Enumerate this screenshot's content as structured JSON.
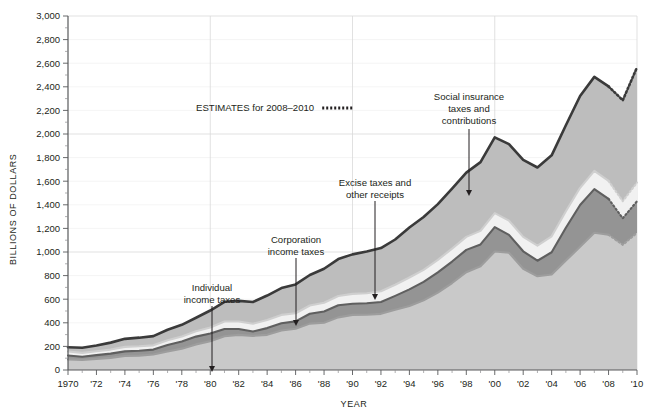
{
  "chart_data": {
    "type": "area",
    "title": "",
    "xlabel": "YEAR",
    "ylabel": "BILLIONS OF DOLLARS",
    "xlim": [
      1970,
      2010
    ],
    "ylim": [
      0,
      3000
    ],
    "ytick_step": 200,
    "grid": true,
    "stacked": true,
    "estimate_start_year": 2008,
    "x": [
      1970,
      1971,
      1972,
      1973,
      1974,
      1975,
      1976,
      1977,
      1978,
      1979,
      1980,
      1981,
      1982,
      1983,
      1984,
      1985,
      1986,
      1987,
      1988,
      1989,
      1990,
      1991,
      1992,
      1993,
      1994,
      1995,
      1996,
      1997,
      1998,
      1999,
      2000,
      2001,
      2002,
      2003,
      2004,
      2005,
      2006,
      2007,
      2008,
      2009,
      2010
    ],
    "xticklabels": [
      "1970",
      "'72",
      "'74",
      "'76",
      "'78",
      "'80",
      "'82",
      "'84",
      "'86",
      "'88",
      "'90",
      "'92",
      "'94",
      "'96",
      "'98",
      "'00",
      "'02",
      "'04",
      "'06",
      "'08",
      "'10"
    ],
    "yticklabels": [
      "0",
      "200",
      "400",
      "600",
      "800",
      "1,000",
      "1,200",
      "1,400",
      "1,600",
      "1,800",
      "2,000",
      "2,200",
      "2,400",
      "2,600",
      "2,800",
      "3,000"
    ],
    "series": [
      {
        "name": "Individual income taxes",
        "fill": "#c9c9c9",
        "stroke": "#9d9d9d",
        "values": [
          90,
          86,
          94,
          103,
          119,
          122,
          131,
          157,
          181,
          217,
          244,
          286,
          298,
          289,
          298,
          335,
          349,
          393,
          401,
          446,
          467,
          468,
          476,
          510,
          543,
          590,
          656,
          737,
          829,
          879,
          1004,
          994,
          858,
          794,
          809,
          927,
          1044,
          1163,
          1146,
          1061,
          1162
        ]
      },
      {
        "name": "Corporation income taxes",
        "fill": "#949494",
        "stroke": "#5f5f5f",
        "values": [
          33,
          26,
          32,
          36,
          39,
          41,
          42,
          55,
          60,
          66,
          65,
          61,
          49,
          37,
          57,
          61,
          63,
          84,
          95,
          103,
          94,
          98,
          100,
          118,
          140,
          157,
          172,
          182,
          189,
          185,
          207,
          151,
          148,
          132,
          189,
          278,
          354,
          370,
          304,
          225,
          268
        ]
      },
      {
        "name": "Excise taxes and other receipts",
        "fill": "#f1f1f1",
        "stroke": "#cfcfcf",
        "values": [
          34,
          33,
          33,
          34,
          38,
          38,
          36,
          41,
          43,
          46,
          51,
          64,
          64,
          66,
          68,
          71,
          69,
          70,
          74,
          78,
          84,
          85,
          91,
          94,
          101,
          102,
          105,
          110,
          110,
          115,
          118,
          121,
          122,
          128,
          135,
          141,
          146,
          154,
          152,
          145,
          158
        ]
      },
      {
        "name": "Social insurance taxes and contributions",
        "fill": "#bdbdbd",
        "stroke": "#3a3a3a",
        "values": [
          36,
          44,
          49,
          59,
          68,
          73,
          78,
          88,
          99,
          114,
          144,
          167,
          175,
          184,
          208,
          227,
          244,
          258,
          288,
          313,
          335,
          354,
          366,
          384,
          424,
          448,
          473,
          508,
          545,
          583,
          643,
          648,
          652,
          662,
          686,
          728,
          778,
          797,
          801,
          855,
          977
        ]
      }
    ],
    "totals_note": "Top heavy line is total receipts (sum of all four categories)",
    "annotations": [
      {
        "name": "individual-income-taxes",
        "lines": [
          "Individual",
          "income taxes"
        ],
        "text_x": 212,
        "text_y": 291,
        "arrow_x": 212,
        "arrow_y_start": 306,
        "arrow_y_end": 372
      },
      {
        "name": "corporation-income-taxes",
        "lines": [
          "Corporation",
          "income taxes"
        ],
        "text_x": 296,
        "text_y": 243,
        "arrow_x": 296,
        "arrow_y_start": 258,
        "arrow_y_end": 326
      },
      {
        "name": "excise-taxes-and-other-receipts",
        "lines": [
          "Excise taxes and",
          "other receipts"
        ],
        "text_x": 375,
        "text_y": 186,
        "arrow_x": 375,
        "arrow_y_start": 201,
        "arrow_y_end": 300
      },
      {
        "name": "social-insurance-taxes-and-contributions",
        "lines": [
          "Social insurance",
          "taxes and",
          "contributions"
        ],
        "text_x": 469,
        "text_y": 100,
        "arrow_x": 469,
        "arrow_y_start": 129,
        "arrow_y_end": 196
      }
    ],
    "legend": {
      "label": "ESTIMATES for 2008–2010",
      "x": 196,
      "y": 111,
      "swatch_style": "dotted-line"
    }
  }
}
